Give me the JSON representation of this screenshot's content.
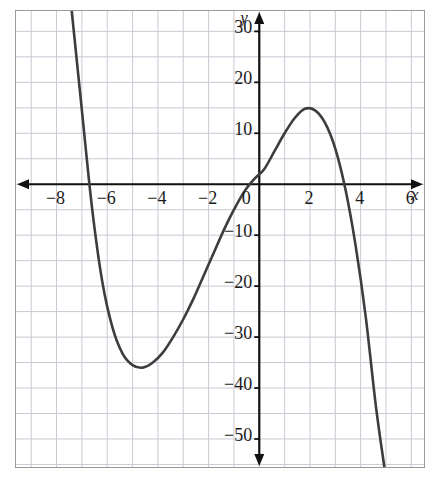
{
  "chart_data": {
    "type": "line",
    "title": "",
    "xlabel": "x",
    "ylabel": "y",
    "xlim": [
      -9.6,
      6.5
    ],
    "ylim": [
      -55.5,
      34
    ],
    "grid": true,
    "legend_position": "none",
    "x_ticks": [
      -8,
      -6,
      -4,
      -2,
      0,
      2,
      4,
      6
    ],
    "x_tick_labels": [
      "−8",
      "−6",
      "−4",
      "−2",
      "0",
      "2",
      "4",
      "6"
    ],
    "y_ticks": [
      30,
      20,
      10,
      -10,
      -20,
      -30,
      -40,
      -50
    ],
    "y_tick_labels": [
      "30",
      "20",
      "10",
      "−10",
      "−20",
      "−30",
      "−40",
      "−50"
    ],
    "x_gridline_step": 1,
    "y_gridline_step": 5,
    "series": [
      {
        "name": "cubic",
        "color": "#3d3d3d",
        "equation": "y = -x^3 - 2.2x^2 + 17.3x",
        "x_intercepts": [
          -5.4,
          0,
          3.2
        ],
        "y_intercept": 0,
        "local_minimum": {
          "x": -3.7,
          "y": -35
        },
        "local_maximum": {
          "x": 1.7,
          "y": 15
        },
        "points": [
          {
            "x": -7.4,
            "y": 34
          },
          {
            "x": -7.0,
            "y": 14.5
          },
          {
            "x": -6.6,
            "y": -4.6
          },
          {
            "x": -6.2,
            "y": -19.0
          },
          {
            "x": -5.8,
            "y": -28.0
          },
          {
            "x": -5.4,
            "y": -33.2
          },
          {
            "x": -5.0,
            "y": -35.5
          },
          {
            "x": -4.6,
            "y": -36.0
          },
          {
            "x": -4.2,
            "y": -35.0
          },
          {
            "x": -3.8,
            "y": -33.0
          },
          {
            "x": -3.4,
            "y": -30.0
          },
          {
            "x": -3.0,
            "y": -26.5
          },
          {
            "x": -2.6,
            "y": -22.5
          },
          {
            "x": -2.2,
            "y": -18.0
          },
          {
            "x": -1.8,
            "y": -13.5
          },
          {
            "x": -1.4,
            "y": -9.0
          },
          {
            "x": -1.0,
            "y": -5.0
          },
          {
            "x": -0.6,
            "y": -1.5
          },
          {
            "x": -0.2,
            "y": 1.0
          },
          {
            "x": 0.2,
            "y": 3.0
          },
          {
            "x": 0.6,
            "y": 6.5
          },
          {
            "x": 1.0,
            "y": 10.0
          },
          {
            "x": 1.4,
            "y": 13.0
          },
          {
            "x": 1.8,
            "y": 14.8
          },
          {
            "x": 2.2,
            "y": 14.5
          },
          {
            "x": 2.6,
            "y": 12.0
          },
          {
            "x": 3.0,
            "y": 7.0
          },
          {
            "x": 3.4,
            "y": -1.0
          },
          {
            "x": 3.8,
            "y": -12.0
          },
          {
            "x": 4.2,
            "y": -26.0
          },
          {
            "x": 4.6,
            "y": -43.5
          },
          {
            "x": 4.95,
            "y": -56.0
          }
        ]
      }
    ]
  },
  "axes": {
    "x_axis_name": "x",
    "y_axis_name": "y",
    "x_axis_arrows": "both",
    "y_axis_arrows": "both"
  },
  "colors": {
    "curve": "#3d3d3d",
    "axis": "#111111",
    "grid": "#c9c9d4",
    "frame": "#9a9a9a",
    "background": "#ffffff",
    "text": "#1a1a1a"
  }
}
